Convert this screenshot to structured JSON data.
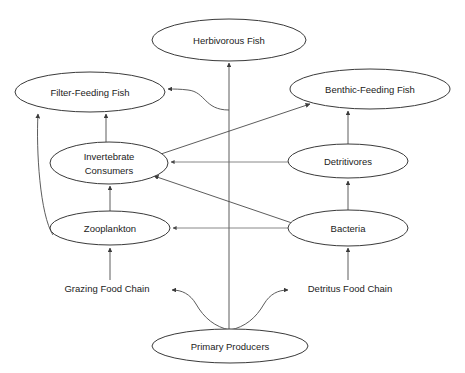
{
  "diagram": {
    "background_color": "#ffffff",
    "node_stroke_color": "#3a3a3a",
    "edge_stroke_color": "#4a4a4a",
    "text_color": "#222222",
    "nodes": [
      {
        "id": "herbivorous-fish",
        "label": "Herbivorous Fish",
        "label_line1": "Herbivorous Fish",
        "label_line2": "",
        "cx": 229,
        "cy": 40,
        "rx": 77,
        "ry": 21
      },
      {
        "id": "filter-feeding-fish",
        "label": "Filter-Feeding Fish",
        "label_line1": "Filter-Feeding Fish",
        "label_line2": "",
        "cx": 90,
        "cy": 92,
        "rx": 75,
        "ry": 20
      },
      {
        "id": "benthic-feeding-fish",
        "label": "Benthic-Feeding Fish",
        "label_line1": "Benthic-Feeding Fish",
        "label_line2": "",
        "cx": 370,
        "cy": 89,
        "rx": 80,
        "ry": 20
      },
      {
        "id": "invertebrate-consumers",
        "label": "Invertebrate Consumers",
        "label_line1": "Invertebrate",
        "label_line2": "Consumers",
        "cx": 109,
        "cy": 163,
        "rx": 59,
        "ry": 21
      },
      {
        "id": "detritivores",
        "label": "Detritivores",
        "label_line1": "Detritivores",
        "label_line2": "",
        "cx": 348,
        "cy": 161,
        "rx": 60,
        "ry": 17
      },
      {
        "id": "zooplankton",
        "label": "Zooplankton",
        "label_line1": "Zooplankton",
        "label_line2": "",
        "cx": 110,
        "cy": 228,
        "rx": 60,
        "ry": 17
      },
      {
        "id": "bacteria",
        "label": "Bacteria",
        "label_line1": "Bacteria",
        "label_line2": "",
        "cx": 348,
        "cy": 228,
        "rx": 60,
        "ry": 18
      },
      {
        "id": "primary-producers",
        "label": "Primary Producers",
        "label_line1": "Primary Producers",
        "label_line2": "",
        "cx": 230,
        "cy": 346,
        "rx": 78,
        "ry": 17
      }
    ],
    "chain_labels": [
      {
        "id": "grazing-food-chain",
        "text": "Grazing Food Chain",
        "x": 107,
        "y": 289
      },
      {
        "id": "detritus-food-chain",
        "text": "Detritus Food Chain",
        "x": 350,
        "y": 289
      }
    ],
    "edges": [
      {
        "id": "primary-producers-to-herbivorous-fish",
        "from": "primary-producers",
        "to": "herbivorous-fish"
      },
      {
        "id": "zooplankton-to-filter-feeding-fish",
        "from": "zooplankton",
        "to": "filter-feeding-fish"
      },
      {
        "id": "invertebrate-consumers-to-filter-feeding-fish",
        "from": "invertebrate-consumers",
        "to": "filter-feeding-fish"
      },
      {
        "id": "detritivores-chain-to-filter-feeding-fish",
        "from": "detritivores",
        "to": "filter-feeding-fish"
      },
      {
        "id": "invertebrate-consumers-to-benthic-feeding-fish",
        "from": "invertebrate-consumers",
        "to": "benthic-feeding-fish"
      },
      {
        "id": "detritivores-to-benthic-feeding-fish",
        "from": "detritivores",
        "to": "benthic-feeding-fish"
      },
      {
        "id": "zooplankton-to-invertebrate-consumers",
        "from": "zooplankton",
        "to": "invertebrate-consumers"
      },
      {
        "id": "detritivores-to-invertebrate-consumers",
        "from": "detritivores",
        "to": "invertebrate-consumers"
      },
      {
        "id": "bacteria-to-invertebrate-consumers",
        "from": "bacteria",
        "to": "invertebrate-consumers"
      },
      {
        "id": "bacteria-to-zooplankton",
        "from": "bacteria",
        "to": "zooplankton"
      },
      {
        "id": "bacteria-to-detritivores",
        "from": "bacteria",
        "to": "detritivores"
      },
      {
        "id": "grazing-chain-to-zooplankton",
        "from": "grazing-food-chain",
        "to": "zooplankton"
      },
      {
        "id": "detritus-chain-to-bacteria",
        "from": "detritus-food-chain",
        "to": "bacteria"
      },
      {
        "id": "primary-producers-to-grazing-chain",
        "from": "primary-producers",
        "to": "grazing-food-chain"
      },
      {
        "id": "primary-producers-to-detritus-chain",
        "from": "primary-producers",
        "to": "detritus-food-chain"
      }
    ]
  }
}
